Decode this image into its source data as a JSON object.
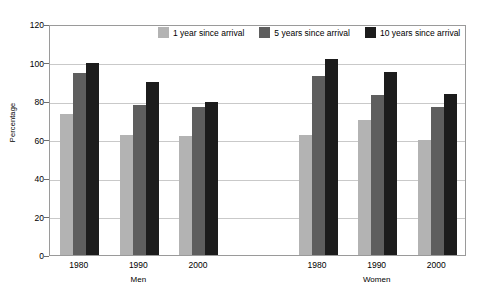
{
  "chart_data": {
    "type": "bar",
    "title": "",
    "xlabel": "",
    "ylabel": "Percentage",
    "ylim": [
      0,
      120
    ],
    "yticks": [
      0,
      20,
      40,
      60,
      80,
      100,
      120
    ],
    "grid": true,
    "legend_position": "top-center",
    "groups": [
      {
        "name": "Men",
        "categories": [
          "1980",
          "1990",
          "2000"
        ]
      },
      {
        "name": "Women",
        "categories": [
          "1980",
          "1990",
          "2000"
        ]
      }
    ],
    "categories": [
      "Men 1980",
      "Men 1990",
      "Men 2000",
      "Women 1980",
      "Women 1990",
      "Women 2000"
    ],
    "series": [
      {
        "name": "1 year since arrival",
        "color": "#b3b3b3",
        "values": [
          73,
          62.5,
          62,
          62.5,
          70,
          59.5
        ]
      },
      {
        "name": "5 years since arrival",
        "color": "#5e5e5e",
        "values": [
          94.5,
          78,
          77,
          93,
          83,
          77
        ]
      },
      {
        "name": "10 years since arrival",
        "color": "#1c1c1c",
        "values": [
          100,
          90,
          79.5,
          102,
          95,
          83.5
        ]
      }
    ]
  }
}
